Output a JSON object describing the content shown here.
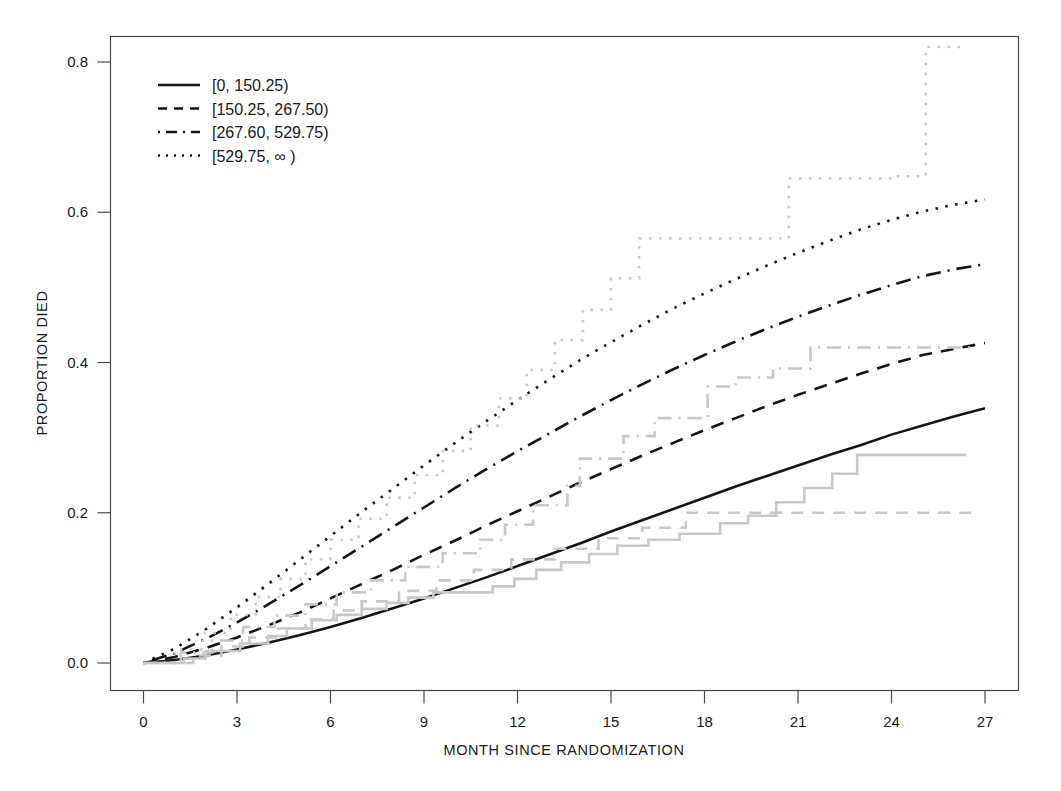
{
  "chart_data": {
    "type": "line",
    "title": "",
    "xlabel": "MONTH SINCE RANDOMIZATION",
    "ylabel": "PROPORTION DIED",
    "xlim": [
      -1.2,
      28.5
    ],
    "ylim": [
      -0.035,
      0.845
    ],
    "xticks": [
      0,
      3,
      6,
      9,
      12,
      15,
      18,
      21,
      24,
      27
    ],
    "yticks": [
      0.0,
      0.2,
      0.4,
      0.6,
      0.8
    ],
    "xtick_labels": [
      "0",
      "3",
      "6",
      "9",
      "12",
      "15",
      "18",
      "21",
      "24",
      "27"
    ],
    "ytick_labels": [
      "0.0",
      "0.2",
      "0.4",
      "0.6",
      "0.8"
    ],
    "grid": false,
    "legend_position": "top-left",
    "colors": {
      "model": "#151515",
      "observed": "#c8c8c8",
      "axis": "#4a4a4a",
      "background": "#ffffff"
    },
    "legend": [
      {
        "label": "[0, 150.25)",
        "dash": "solid",
        "sample_dasharray": "none"
      },
      {
        "label": "[150.25, 267.50)",
        "dash": "dashed",
        "sample_dasharray": "9,7"
      },
      {
        "label": "[267.60, 529.75)",
        "dash": "dashdot",
        "sample_dasharray": "2,6,11,6"
      },
      {
        "label": "[529.75, ∞ )",
        "dash": "dotted",
        "sample_dasharray": "2,6"
      }
    ],
    "series": [
      {
        "name": "[0, 150.25)",
        "kind": "model",
        "dash": "solid",
        "dasharray": "none",
        "x": [
          0,
          1,
          2,
          3,
          4,
          5,
          6,
          7,
          8,
          9,
          10,
          11,
          12,
          13,
          14,
          15,
          16,
          17,
          18,
          19,
          20,
          21,
          22,
          23,
          24,
          25,
          26,
          27
        ],
        "y": [
          0.0,
          0.004,
          0.01,
          0.018,
          0.027,
          0.037,
          0.048,
          0.06,
          0.073,
          0.086,
          0.1,
          0.114,
          0.129,
          0.144,
          0.159,
          0.175,
          0.19,
          0.205,
          0.22,
          0.235,
          0.249,
          0.263,
          0.277,
          0.29,
          0.304,
          0.316,
          0.328,
          0.339
        ]
      },
      {
        "name": "[150.25, 267.50)",
        "kind": "model",
        "dash": "dashed",
        "dasharray": "13,9",
        "x": [
          0,
          1,
          2,
          3,
          4,
          5,
          6,
          7,
          8,
          9,
          10,
          11,
          12,
          13,
          14,
          15,
          16,
          17,
          18,
          19,
          20,
          21,
          22,
          23,
          24,
          25,
          26,
          27
        ],
        "y": [
          0.0,
          0.008,
          0.02,
          0.034,
          0.05,
          0.067,
          0.086,
          0.105,
          0.124,
          0.144,
          0.163,
          0.183,
          0.202,
          0.221,
          0.24,
          0.258,
          0.276,
          0.293,
          0.31,
          0.326,
          0.342,
          0.357,
          0.371,
          0.385,
          0.398,
          0.41,
          0.418,
          0.426
        ]
      },
      {
        "name": "[267.60, 529.75)",
        "kind": "model",
        "dash": "dashdot",
        "dasharray": "2,7,15,7",
        "x": [
          0,
          1,
          2,
          3,
          4,
          5,
          6,
          7,
          8,
          9,
          10,
          11,
          12,
          13,
          14,
          15,
          16,
          17,
          18,
          19,
          20,
          21,
          22,
          23,
          24,
          25,
          26,
          27
        ],
        "y": [
          0.0,
          0.013,
          0.032,
          0.054,
          0.078,
          0.103,
          0.129,
          0.155,
          0.181,
          0.207,
          0.233,
          0.258,
          0.282,
          0.305,
          0.328,
          0.35,
          0.371,
          0.391,
          0.41,
          0.428,
          0.445,
          0.461,
          0.476,
          0.49,
          0.503,
          0.515,
          0.524,
          0.531
        ]
      },
      {
        "name": "[529.75, ∞ )",
        "kind": "model",
        "dash": "dotted",
        "dasharray": "2.5,7.5",
        "x": [
          0,
          1,
          2,
          3,
          4,
          5,
          6,
          7,
          8,
          9,
          10,
          11,
          12,
          13,
          14,
          15,
          16,
          17,
          18,
          19,
          20,
          21,
          22,
          23,
          24,
          25,
          26,
          27
        ],
        "y": [
          0.0,
          0.019,
          0.045,
          0.074,
          0.105,
          0.137,
          0.169,
          0.201,
          0.232,
          0.263,
          0.293,
          0.322,
          0.35,
          0.377,
          0.403,
          0.427,
          0.45,
          0.472,
          0.492,
          0.511,
          0.529,
          0.546,
          0.562,
          0.577,
          0.59,
          0.601,
          0.61,
          0.617
        ]
      },
      {
        "name": "[0, 150.25) observed",
        "kind": "observed",
        "dash": "solid",
        "dasharray": "none",
        "x": [
          0,
          1.3,
          1.3,
          2.0,
          2.0,
          3.1,
          3.1,
          4.0,
          4.0,
          4.6,
          4.6,
          5.4,
          5.4,
          6.2,
          6.2,
          7.0,
          7.0,
          7.8,
          7.8,
          8.5,
          8.5,
          9.3,
          9.3,
          11.2,
          11.2,
          11.9,
          11.9,
          12.6,
          12.6,
          13.4,
          13.4,
          14.3,
          14.3,
          15.2,
          15.2,
          16.2,
          16.2,
          17.2,
          17.2,
          18.5,
          18.5,
          19.4,
          19.4,
          20.3,
          20.3,
          21.2,
          21.2,
          22.1,
          22.1,
          22.9,
          22.9,
          26.4
        ],
        "y": [
          0.0,
          0.0,
          0.006,
          0.006,
          0.016,
          0.016,
          0.026,
          0.026,
          0.036,
          0.036,
          0.046,
          0.046,
          0.057,
          0.057,
          0.064,
          0.064,
          0.072,
          0.072,
          0.08,
          0.08,
          0.087,
          0.087,
          0.094,
          0.094,
          0.102,
          0.102,
          0.112,
          0.112,
          0.124,
          0.124,
          0.134,
          0.134,
          0.145,
          0.145,
          0.156,
          0.156,
          0.164,
          0.164,
          0.172,
          0.172,
          0.186,
          0.186,
          0.196,
          0.196,
          0.214,
          0.214,
          0.233,
          0.233,
          0.252,
          0.252,
          0.277,
          0.277
        ]
      },
      {
        "name": "[150.25, 267.50) observed",
        "kind": "observed",
        "dash": "dashed",
        "dasharray": "12,9",
        "x": [
          0,
          1.6,
          1.6,
          2.5,
          2.5,
          3.4,
          3.4,
          4.3,
          4.3,
          5.2,
          5.2,
          6.1,
          6.1,
          7.0,
          7.0,
          8.2,
          8.2,
          9.4,
          9.4,
          10.6,
          10.6,
          11.8,
          11.8,
          13.2,
          13.2,
          14.6,
          14.6,
          16.0,
          16.0,
          17.4,
          17.4,
          26.6
        ],
        "y": [
          0.0,
          0.0,
          0.01,
          0.01,
          0.022,
          0.022,
          0.034,
          0.034,
          0.046,
          0.046,
          0.058,
          0.058,
          0.07,
          0.07,
          0.082,
          0.082,
          0.096,
          0.096,
          0.11,
          0.11,
          0.124,
          0.124,
          0.138,
          0.138,
          0.152,
          0.152,
          0.166,
          0.166,
          0.18,
          0.18,
          0.2,
          0.2
        ]
      },
      {
        "name": "[267.60, 529.75) observed",
        "kind": "observed",
        "dash": "dashdot",
        "dasharray": "2,7,14,7",
        "x": [
          0,
          1.2,
          1.2,
          2.2,
          2.2,
          3.2,
          3.2,
          4.2,
          4.2,
          5.2,
          5.2,
          6.2,
          6.2,
          7.3,
          7.3,
          8.4,
          8.4,
          9.6,
          9.6,
          10.8,
          10.8,
          11.6,
          11.6,
          12.5,
          12.5,
          13.6,
          13.6,
          14.0,
          14.0,
          15.4,
          15.4,
          16.4,
          16.4,
          18.1,
          18.1,
          19.0,
          19.0,
          20.2,
          20.2,
          21.4,
          21.4,
          26.6
        ],
        "y": [
          0.0,
          0.0,
          0.014,
          0.014,
          0.03,
          0.03,
          0.048,
          0.048,
          0.063,
          0.063,
          0.078,
          0.078,
          0.094,
          0.094,
          0.11,
          0.11,
          0.128,
          0.128,
          0.146,
          0.146,
          0.164,
          0.164,
          0.184,
          0.184,
          0.21,
          0.21,
          0.236,
          0.236,
          0.272,
          0.272,
          0.302,
          0.302,
          0.326,
          0.326,
          0.368,
          0.368,
          0.38,
          0.38,
          0.392,
          0.392,
          0.42,
          0.42
        ]
      },
      {
        "name": "[529.75, ∞ ) observed",
        "kind": "observed",
        "dash": "dotted",
        "dasharray": "2.5,7.5",
        "x": [
          0,
          1.0,
          1.0,
          1.9,
          1.9,
          2.8,
          2.8,
          3.6,
          3.6,
          4.4,
          4.4,
          5.2,
          5.2,
          6.0,
          6.0,
          6.9,
          6.9,
          7.8,
          7.8,
          8.7,
          8.7,
          9.6,
          9.6,
          10.5,
          10.5,
          11.4,
          11.4,
          12.3,
          12.3,
          13.2,
          13.2,
          14.1,
          14.1,
          15.0,
          15.0,
          15.9,
          15.9,
          20.7,
          20.7,
          24.0,
          24.0,
          25.1,
          25.1,
          26.2
        ],
        "y": [
          0.0,
          0.0,
          0.018,
          0.018,
          0.04,
          0.04,
          0.064,
          0.064,
          0.088,
          0.088,
          0.112,
          0.112,
          0.138,
          0.138,
          0.164,
          0.164,
          0.192,
          0.192,
          0.22,
          0.22,
          0.25,
          0.25,
          0.282,
          0.282,
          0.316,
          0.316,
          0.352,
          0.352,
          0.39,
          0.39,
          0.43,
          0.43,
          0.47,
          0.47,
          0.512,
          0.512,
          0.565,
          0.565,
          0.645,
          0.645,
          0.648,
          0.648,
          0.82,
          0.82
        ]
      }
    ]
  }
}
